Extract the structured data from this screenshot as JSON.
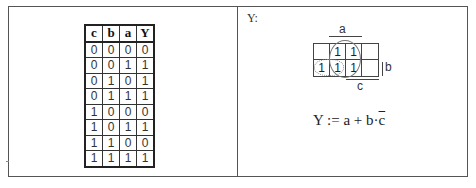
{
  "truth_table": {
    "headers": [
      "c",
      "b",
      "a",
      "Y"
    ],
    "rows": [
      [
        "0",
        "0",
        "0",
        "0"
      ],
      [
        "0",
        "0",
        "1",
        "1"
      ],
      [
        "0",
        "1",
        "0",
        "1"
      ],
      [
        "0",
        "1",
        "1",
        "1"
      ],
      [
        "1",
        "0",
        "0",
        "0"
      ],
      [
        "1",
        "0",
        "1",
        "1"
      ],
      [
        "1",
        "1",
        "0",
        "0"
      ],
      [
        "1",
        "1",
        "1",
        "1"
      ]
    ]
  },
  "kmap_panel": {
    "title": "Y:",
    "labels": {
      "a": "a",
      "b": "b",
      "c": "c"
    },
    "cells": [
      [
        "",
        "1",
        "1",
        ""
      ],
      [
        "1",
        "1",
        "1",
        ""
      ]
    ],
    "groups": [
      {
        "name": "a",
        "style": "solid",
        "cells": "columns 2-3, both rows"
      },
      {
        "name": "b·c̄",
        "style": "dotted",
        "cells": "row 2, columns 1-2"
      }
    ],
    "formula": {
      "lhs": "Y",
      "op": ":=",
      "term1": "a",
      "plus": "+",
      "term2": "b",
      "dot": "·",
      "term3": "c",
      "term3_negated": true
    }
  }
}
